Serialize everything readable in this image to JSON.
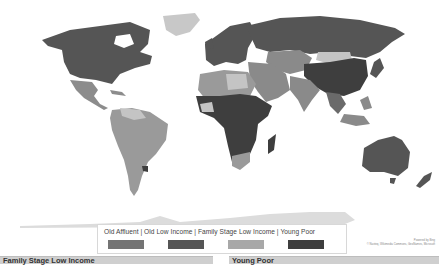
{
  "map": {
    "type": "choropleth world map",
    "colors": {
      "old_affluent": "#747474",
      "old_low_income": "#555555",
      "family_stage_low_income": "#a8a8a8",
      "young_poor": "#3e3e3e",
      "unassigned": "#d4d4d4",
      "antarctica": "#dcdcdc"
    }
  },
  "legend": {
    "text": "Old Affluent  |  Old Low Income  |  Family Stage Low Income  |  Young Poor",
    "items": [
      {
        "label": "Old Affluent",
        "color": "#747474"
      },
      {
        "label": "Old Low Income",
        "color": "#555555"
      },
      {
        "label": "Family Stage Low Income",
        "color": "#a8a8a8"
      },
      {
        "label": "Young Poor",
        "color": "#3e3e3e"
      }
    ]
  },
  "attribution": {
    "line1": "Powered by Bing",
    "line2": "© Navteq, Wikimedia Commons, GeoNames, Microsoft"
  },
  "panels": [
    {
      "title": "Family Stage Low Income"
    },
    {
      "title": "Young Poor"
    }
  ]
}
